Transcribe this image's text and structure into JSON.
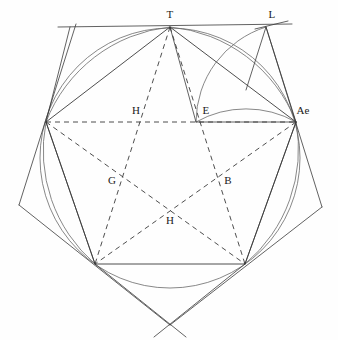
{
  "figure": {
    "type": "geometric-construction",
    "width": 338,
    "height": 340,
    "background_color": "#fefefe",
    "stroke_color": "#3a3a3a",
    "stroke_color_light": "#6a6a6a",
    "label_color": "#1a1a1a"
  },
  "labels": [
    {
      "id": "T",
      "text": "T",
      "x": 170,
      "y": 14
    },
    {
      "id": "L",
      "text": "L",
      "x": 272,
      "y": 14
    },
    {
      "id": "Ae",
      "text": "Ae",
      "x": 303,
      "y": 110
    },
    {
      "id": "H1",
      "text": "H",
      "x": 136,
      "y": 110
    },
    {
      "id": "E",
      "text": "E",
      "x": 206,
      "y": 110
    },
    {
      "id": "G",
      "text": "G",
      "x": 112,
      "y": 180
    },
    {
      "id": "B",
      "text": "B",
      "x": 228,
      "y": 180
    },
    {
      "id": "H2",
      "text": "H",
      "x": 170,
      "y": 220
    }
  ],
  "points": {
    "T": {
      "x": 170,
      "y": 27
    },
    "L": {
      "x": 266,
      "y": 27
    },
    "Ae": {
      "x": 296,
      "y": 122
    },
    "E": {
      "x": 196,
      "y": 122
    },
    "V_left": {
      "x": 46,
      "y": 122
    },
    "V_bl": {
      "x": 95,
      "y": 264
    },
    "V_br": {
      "x": 245,
      "y": 264
    },
    "X_bottom": {
      "x": 170,
      "y": 325
    },
    "X_left": {
      "x": 19,
      "y": 205
    },
    "X_right": {
      "x": 322,
      "y": 207
    },
    "H_upper": {
      "x": 143,
      "y": 122
    },
    "G": {
      "x": 120,
      "y": 175
    },
    "B": {
      "x": 220,
      "y": 175
    },
    "H_lower": {
      "x": 170,
      "y": 213
    },
    "top_line_left": {
      "x": 58,
      "y": 27
    },
    "top_line_right": {
      "x": 292,
      "y": 24
    }
  },
  "circle": {
    "center_x": 170,
    "center_y": 158,
    "radius": 130
  },
  "arcs": [
    {
      "id": "arc-left-to-T",
      "description": "arc from left vertex up to T"
    },
    {
      "id": "arc-T-to-Ae",
      "description": "arc from T sweeping right to Ae"
    },
    {
      "id": "arc-E-to-L",
      "description": "arc from E curving up to L"
    },
    {
      "id": "arc-E-to-Ae",
      "description": "arc from E curving right to Ae"
    },
    {
      "id": "arc-Ae-to-br",
      "description": "arc from Ae down to bottom-right vertex"
    }
  ]
}
